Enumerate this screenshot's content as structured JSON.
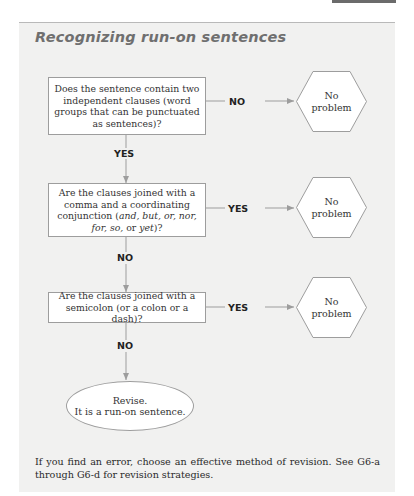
{
  "header": {
    "tab_color": "#6b6b6b"
  },
  "panel": {
    "title": "Recognizing run-on sentences",
    "background": "#f1f1f0"
  },
  "flowchart": {
    "questions": [
      {
        "text": "Does the sentence contain two independent clauses (word groups that can be punctuated as sentences)?",
        "branch_right": "NO",
        "branch_down": "YES"
      },
      {
        "text_pre": "Are the clauses joined with a comma and a coordinating conjunction (",
        "text_italic_1": "and, but, or, nor,",
        "text_italic_2": "for, so,",
        "text_mid": " or ",
        "text_italic_3": "yet",
        "text_post": ")?",
        "branch_right": "YES",
        "branch_down": "NO"
      },
      {
        "text": "Are the clauses joined with a semicolon (or a colon or a dash)?",
        "branch_right": "YES",
        "branch_down": "NO"
      }
    ],
    "outcomes": [
      {
        "line1": "No",
        "line2": "problem"
      },
      {
        "line1": "No",
        "line2": "problem"
      },
      {
        "line1": "No",
        "line2": "problem"
      }
    ],
    "terminal": {
      "line1": "Revise.",
      "line2": "It is a run-on sentence."
    }
  },
  "footer": {
    "text": "If you find an error, choose an effective method of revision. See G6-a through G6-d for revision strategies."
  }
}
